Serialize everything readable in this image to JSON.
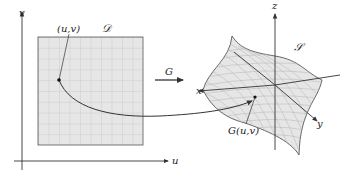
{
  "figure": {
    "domain_label": "𝒟",
    "surface_label": "𝒮",
    "point_label": "(u,v)",
    "image_point_label": "G(u,v)",
    "map_label": "G",
    "axes2d": {
      "horizontal": "u",
      "vertical": "v"
    },
    "axes3d": {
      "x": "x",
      "y": "y",
      "z": "z"
    }
  },
  "colors": {
    "region_fill": "#e6e6e6",
    "grid_line": "#bdbdbd",
    "stroke": "#333333",
    "background": "#ffffff"
  }
}
